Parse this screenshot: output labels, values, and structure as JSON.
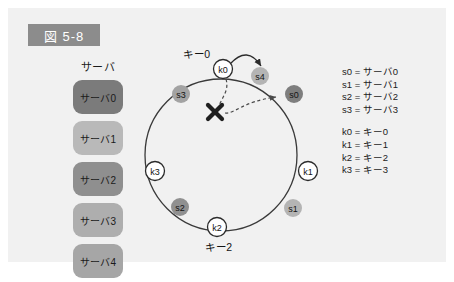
{
  "figure": {
    "badge_label": "図 5-8",
    "badge_color": "#8c8c8c",
    "panel_color": "#f1f1f1"
  },
  "server_column": {
    "title": "サーバ",
    "boxes": [
      {
        "label": "サーバ0",
        "color": "#7b7b7b"
      },
      {
        "label": "サーバ1",
        "color": "#b9b9b9"
      },
      {
        "label": "サーバ2",
        "color": "#8f8f8f"
      },
      {
        "label": "サーバ3",
        "color": "#aeaeae"
      },
      {
        "label": "サーバ4",
        "color": "#a6a6a6"
      }
    ]
  },
  "legend": {
    "servers": [
      "s0 = サーバ0",
      "s1 = サーバ1",
      "s2 = サーバ2",
      "s3 = サーバ3"
    ],
    "keys": [
      "k0 = キー0",
      "k1 = キー1",
      "k2 = キー2",
      "k3 = キー3"
    ]
  },
  "ring": {
    "center_x": 213,
    "center_y": 147,
    "radius": 76,
    "stroke_color": "#3a3a3a",
    "nodes": [
      {
        "id": "k0",
        "label": "k0",
        "type": "key",
        "cx": 215,
        "cy": 61,
        "r": 9.5,
        "fill": "#ffffff",
        "stroke": "#2b2b2b"
      },
      {
        "id": "s4",
        "label": "s4",
        "type": "server",
        "cx": 252,
        "cy": 68,
        "r": 9.0,
        "fill": "#b4b4b4",
        "stroke": "none"
      },
      {
        "id": "s0",
        "label": "s0",
        "type": "server",
        "cx": 286,
        "cy": 86,
        "r": 9.0,
        "fill": "#7e7e7e",
        "stroke": "none"
      },
      {
        "id": "k1",
        "label": "k1",
        "type": "key",
        "cx": 300,
        "cy": 163,
        "r": 9.5,
        "fill": "#ffffff",
        "stroke": "#2b2b2b"
      },
      {
        "id": "s1",
        "label": "s1",
        "type": "server",
        "cx": 285,
        "cy": 200,
        "r": 9.0,
        "fill": "#b4b4b4",
        "stroke": "none"
      },
      {
        "id": "k2",
        "label": "k2",
        "type": "key",
        "cx": 209,
        "cy": 219,
        "r": 9.5,
        "fill": "#ffffff",
        "stroke": "#2b2b2b"
      },
      {
        "id": "s2",
        "label": "s2",
        "type": "server",
        "cx": 172,
        "cy": 199,
        "r": 9.0,
        "fill": "#909090",
        "stroke": "none"
      },
      {
        "id": "k3",
        "label": "k3",
        "type": "key",
        "cx": 147,
        "cy": 163,
        "r": 9.5,
        "fill": "#ffffff",
        "stroke": "#2b2b2b"
      },
      {
        "id": "s3",
        "label": "s3",
        "type": "server",
        "cx": 173,
        "cy": 86,
        "r": 9.0,
        "fill": "#a3a3a3",
        "stroke": "none"
      }
    ],
    "annotations": [
      {
        "id": "key0-label",
        "text": "キー0",
        "x": 189,
        "y": 50
      },
      {
        "id": "key2-label",
        "text": "キー2",
        "x": 211,
        "y": 243
      }
    ],
    "arrows": {
      "solid_reassign": "k0 → s4",
      "dashed_failed": "k0 → s0 (blocked by X)",
      "cross_marker_x": 207,
      "cross_marker_y": 104
    }
  }
}
